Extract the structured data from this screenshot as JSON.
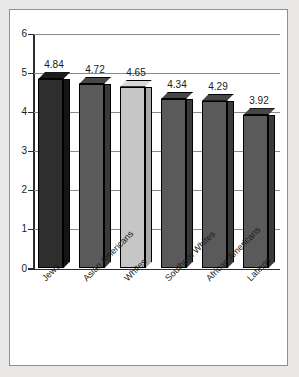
{
  "chart_data": {
    "type": "bar",
    "title": "",
    "subtitle": "",
    "xlabel": "",
    "ylabel": "",
    "ylim": [
      0,
      6
    ],
    "ytick_labels": [
      "0",
      "1",
      "2",
      "3",
      "4",
      "5",
      "6"
    ],
    "ytick_values": [
      0,
      1,
      2,
      3,
      4,
      5,
      6
    ],
    "grid": true,
    "legend": "none",
    "three_d": true,
    "categories": [
      "Jews",
      "Asian Americans",
      "Whites",
      "Southern Whites",
      "African Americans",
      "Latinos"
    ],
    "values": [
      4.84,
      4.72,
      4.65,
      4.34,
      4.29,
      3.92
    ],
    "value_labels": [
      "4.84",
      "4.72",
      "4.65",
      "4.34",
      "4.29",
      "3.92"
    ],
    "bar_colors": [
      "#2e2e2e",
      "#5a5a5a",
      "#c6c6c6",
      "#5a5a5a",
      "#5a5a5a",
      "#5a5a5a"
    ],
    "bar_top_colors": [
      "#1b1b1b",
      "#464646",
      "#d9d9d9",
      "#464646",
      "#464646",
      "#464646"
    ],
    "bar_side_colors": [
      "#151515",
      "#3a3a3a",
      "#a8a8a8",
      "#3a3a3a",
      "#3a3a3a",
      "#3a3a3a"
    ],
    "axis_color": "#2b2b2b",
    "grid_color": "#8a8a8a",
    "plot_background": "#ffffff",
    "page_background": "#e9e8e6",
    "frame_border_color": "#8d8f92"
  }
}
